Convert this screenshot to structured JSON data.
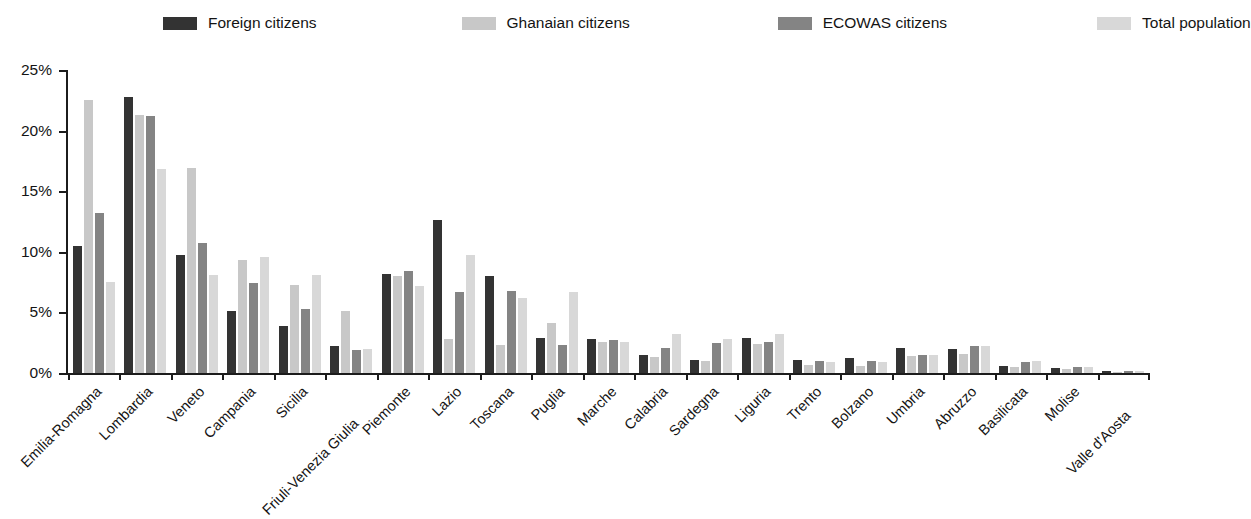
{
  "chart_data": {
    "type": "bar",
    "title": "",
    "subtitle": "",
    "xlabel": "",
    "ylabel": "",
    "ylim": [
      0,
      25
    ],
    "ytick_labels": [
      "0%",
      "5%",
      "10%",
      "15%",
      "20%",
      "25%"
    ],
    "ytick_values": [
      0,
      5,
      10,
      15,
      20,
      25
    ],
    "grid": false,
    "legend_position": "top",
    "value_unit": "%",
    "categories": [
      "Emilia-Romagna",
      "Lombardia",
      "Veneto",
      "Campania",
      "Sicilia",
      "Friuli-Venezia Giulia",
      "Piemonte",
      "Lazio",
      "Toscana",
      "Puglia",
      "Marche",
      "Calabria",
      "Sardegna",
      "Liguria",
      "Trento",
      "Bolzano",
      "Umbria",
      "Abruzzo",
      "Basilicata",
      "Molise",
      "Valle d'Aosta"
    ],
    "series": [
      {
        "name": "Foreign citizens",
        "color": "#333333",
        "values": [
          10.5,
          22.8,
          9.7,
          5.1,
          3.9,
          2.2,
          8.2,
          12.6,
          8.0,
          2.9,
          2.8,
          1.5,
          1.1,
          2.9,
          1.1,
          1.2,
          2.1,
          2.0,
          0.6,
          0.4,
          0.2
        ]
      },
      {
        "name": "Ghanaian citizens",
        "color": "#c8c8c8",
        "values": [
          22.5,
          21.3,
          16.9,
          9.3,
          7.3,
          5.1,
          8.0,
          2.8,
          2.3,
          4.1,
          2.6,
          1.3,
          1.0,
          2.4,
          0.7,
          0.6,
          1.4,
          1.6,
          0.5,
          0.3,
          0.1
        ]
      },
      {
        "name": "ECOWAS citizens",
        "color": "#848484",
        "values": [
          13.2,
          21.2,
          10.7,
          7.4,
          5.3,
          1.9,
          8.4,
          6.7,
          6.8,
          2.3,
          2.7,
          2.1,
          2.5,
          2.6,
          1.0,
          1.0,
          1.5,
          2.2,
          0.9,
          0.5,
          0.2
        ]
      },
      {
        "name": "Total population",
        "color": "#d8d8d8",
        "values": [
          7.5,
          16.8,
          8.1,
          9.6,
          8.1,
          2.0,
          7.2,
          9.7,
          6.2,
          6.7,
          2.6,
          3.2,
          2.8,
          3.2,
          0.9,
          0.9,
          1.5,
          2.2,
          1.0,
          0.5,
          0.2
        ]
      }
    ]
  }
}
